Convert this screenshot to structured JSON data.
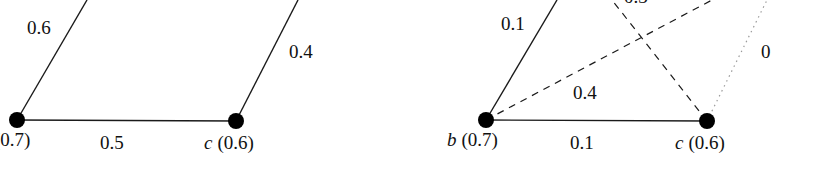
{
  "panels": [
    {
      "id": "left",
      "nodes": [
        {
          "name": "b",
          "score": "(0.7)",
          "label": "(0.7)",
          "x": 17,
          "y": 120
        },
        {
          "name": "c",
          "score": "(0.6)",
          "label_name": "c",
          "label_score": "(0.6)",
          "x": 236,
          "y": 121
        }
      ],
      "edges": [
        {
          "from": "b",
          "to": "offscreen-top-left",
          "weight": "0.6",
          "style": "solid"
        },
        {
          "from": "c",
          "to": "offscreen-top-right",
          "weight": "0.4",
          "style": "solid"
        },
        {
          "from": "b",
          "to": "c",
          "weight": "0.5",
          "style": "solid"
        }
      ]
    },
    {
      "id": "right",
      "nodes": [
        {
          "name": "b",
          "label_name": "b",
          "label_score": "(0.7)",
          "x": 486,
          "y": 120
        },
        {
          "name": "c",
          "label_name": "c",
          "label_score": "(0.6)",
          "x": 707,
          "y": 121
        }
      ],
      "edges": [
        {
          "from": "b",
          "to": "offscreen-top",
          "weight": "0.1",
          "style": "solid"
        },
        {
          "from": "b",
          "to": "offscreen-top-right",
          "weight": "0.4",
          "style": "dashed"
        },
        {
          "from": "c",
          "to": "offscreen-top-left",
          "weight": "0.3",
          "style": "dashed"
        },
        {
          "from": "c",
          "to": "offscreen-top-right",
          "weight": "0",
          "style": "dotted"
        },
        {
          "from": "b",
          "to": "c",
          "weight": "0.1",
          "style": "solid"
        }
      ]
    }
  ],
  "colors": {
    "line": "#1a1a1a",
    "node": "#000000",
    "background": "#ffffff",
    "dotted": "#9a9a9a"
  }
}
